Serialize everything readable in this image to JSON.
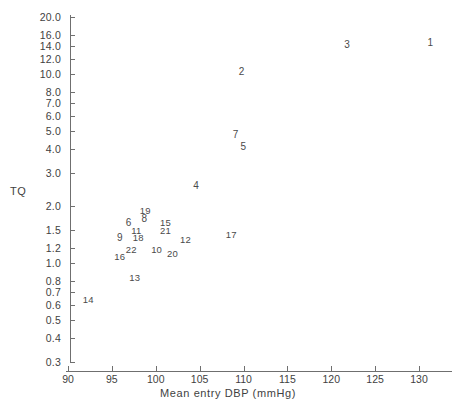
{
  "chart_data": {
    "type": "scatter",
    "title": "",
    "xlabel": "Mean entry DBP (mmHg)",
    "ylabel": "TQ",
    "xlim": [
      88.5,
      134.5
    ],
    "ylim": [
      0.3,
      21.0
    ],
    "yscale": "log",
    "grid": false,
    "legend": "none",
    "marker_style": "numeric-label",
    "xticks": [
      90,
      95,
      100,
      105,
      110,
      115,
      120,
      125,
      130
    ],
    "xtick_labels": [
      "90",
      "95",
      "100",
      "105",
      "110",
      "115",
      "120",
      "125",
      "130"
    ],
    "yticks": [
      20.0,
      16.0,
      14.0,
      12.0,
      10.0,
      8.0,
      7.0,
      6.0,
      5.0,
      4.0,
      3.0,
      2.0,
      1.5,
      1.2,
      1.0,
      0.8,
      0.7,
      0.6,
      0.5,
      0.4,
      0.3
    ],
    "ytick_labels": [
      "20.0",
      "16.0",
      "14.0",
      "12.0",
      "10.0",
      "8.0",
      "7.0",
      "6.0",
      "5.0",
      "4.0",
      "3.0",
      "2.0",
      "1.5",
      "1.2",
      "1.0",
      "0.8",
      "0.7",
      "0.6",
      "0.5",
      "0.4",
      "0.3"
    ],
    "points": [
      {
        "label": "1",
        "x": 131.3,
        "y": 14.5
      },
      {
        "label": "2",
        "x": 109.8,
        "y": 10.2
      },
      {
        "label": "3",
        "x": 121.8,
        "y": 14.3
      },
      {
        "label": "4",
        "x": 104.6,
        "y": 2.55
      },
      {
        "label": "5",
        "x": 110.0,
        "y": 4.1
      },
      {
        "label": "6",
        "x": 96.9,
        "y": 1.63
      },
      {
        "label": "7",
        "x": 109.1,
        "y": 4.75
      },
      {
        "label": "8",
        "x": 98.7,
        "y": 1.72
      },
      {
        "label": "9",
        "x": 95.9,
        "y": 1.35
      },
      {
        "label": "10",
        "x": 100.1,
        "y": 1.17
      },
      {
        "label": "11",
        "x": 97.8,
        "y": 1.48
      },
      {
        "label": "12",
        "x": 103.4,
        "y": 1.33
      },
      {
        "label": "13",
        "x": 97.6,
        "y": 0.83
      },
      {
        "label": "14",
        "x": 92.3,
        "y": 0.64
      },
      {
        "label": "15",
        "x": 101.1,
        "y": 1.63
      },
      {
        "label": "16",
        "x": 95.9,
        "y": 1.08
      },
      {
        "label": "17",
        "x": 108.6,
        "y": 1.4
      },
      {
        "label": "18",
        "x": 98.0,
        "y": 1.35
      },
      {
        "label": "19",
        "x": 98.8,
        "y": 1.88
      },
      {
        "label": "20",
        "x": 101.9,
        "y": 1.12
      },
      {
        "label": "21",
        "x": 101.1,
        "y": 1.48
      },
      {
        "label": "22",
        "x": 97.2,
        "y": 1.17
      }
    ]
  }
}
